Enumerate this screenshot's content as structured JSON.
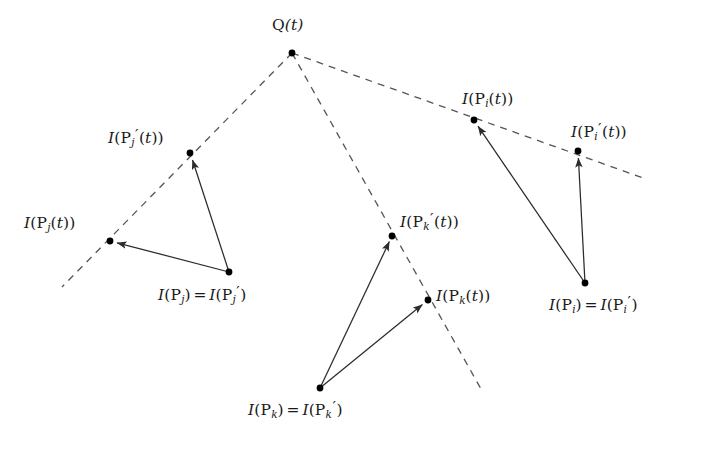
{
  "figure": {
    "type": "geometric-diagram",
    "background_color": "#ffffff",
    "stroke_color": "#2b2b2b",
    "dash_color": "#555555",
    "point_color": "#000000"
  },
  "labels": {
    "q": "Q(t)",
    "q_parts": {
      "base": "Q",
      "arg": "(t)"
    },
    "j_image_prime": "I(P_j'(t))",
    "j_image": "I(P_j(t))",
    "j_source": "I(P_j) = I(P_j')",
    "k_image_prime": "I(P_k'(t))",
    "k_image": "I(P_k(t))",
    "k_source": "I(P_k) = I(P_k')",
    "i_image": "I(P_i(t))",
    "i_image_prime": "I(P_i'(t))",
    "i_source": "I(P_i) = I(P_i')"
  },
  "subscripts": {
    "j": "j",
    "k": "k",
    "i": "i"
  },
  "geometry": {
    "q_point": [
      292,
      53
    ],
    "rays": [
      {
        "name": "ray-j",
        "from": [
          292,
          53
        ],
        "to": [
          62,
          287
        ]
      },
      {
        "name": "ray-k",
        "from": [
          292,
          53
        ],
        "to": [
          481,
          389
        ]
      },
      {
        "name": "ray-i",
        "from": [
          292,
          53
        ],
        "to": [
          646,
          179
        ]
      }
    ],
    "points": [
      {
        "name": "point-q",
        "xy": [
          292,
          53
        ]
      },
      {
        "name": "point-j-image-prime",
        "xy": [
          190,
          153
        ]
      },
      {
        "name": "point-j-image",
        "xy": [
          110,
          241
        ]
      },
      {
        "name": "point-j-source",
        "xy": [
          229,
          272
        ]
      },
      {
        "name": "point-k-image-prime",
        "xy": [
          392,
          236
        ]
      },
      {
        "name": "point-k-image",
        "xy": [
          428,
          300
        ]
      },
      {
        "name": "point-k-source",
        "xy": [
          320,
          388
        ]
      },
      {
        "name": "point-i-image",
        "xy": [
          474,
          120
        ]
      },
      {
        "name": "point-i-image-prime",
        "xy": [
          578,
          151
        ]
      },
      {
        "name": "point-i-source",
        "xy": [
          585,
          283
        ]
      }
    ],
    "arrows": [
      {
        "name": "arrow-j-source-to-j-image-prime",
        "from": [
          229,
          272
        ],
        "to": [
          190,
          153
        ]
      },
      {
        "name": "arrow-j-source-to-j-image",
        "from": [
          229,
          272
        ],
        "to": [
          110,
          241
        ]
      },
      {
        "name": "arrow-k-source-to-k-image-prime",
        "from": [
          320,
          388
        ],
        "to": [
          392,
          236
        ]
      },
      {
        "name": "arrow-k-source-to-k-image",
        "from": [
          320,
          388
        ],
        "to": [
          428,
          300
        ]
      },
      {
        "name": "arrow-i-source-to-i-image",
        "from": [
          585,
          283
        ],
        "to": [
          474,
          120
        ]
      },
      {
        "name": "arrow-i-source-to-i-image-prime",
        "from": [
          585,
          283
        ],
        "to": [
          578,
          151
        ]
      }
    ]
  }
}
